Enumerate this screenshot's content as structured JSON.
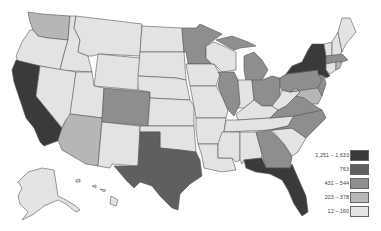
{
  "map": {
    "title": "",
    "region": "United States",
    "colors": {
      "bin1": "#3a3a3a",
      "bin2": "#5f5f5f",
      "bin3": "#8e8e8e",
      "bin4": "#b6b6b6",
      "bin5": "#e3e3e3",
      "stroke": "#555555"
    },
    "legend": [
      {
        "label": "1,251 – 1,633",
        "bin": "bin1",
        "color": "#3a3a3a"
      },
      {
        "label": "763",
        "bin": "bin2",
        "color": "#5f5f5f"
      },
      {
        "label": "431 – 544",
        "bin": "bin3",
        "color": "#8e8e8e"
      },
      {
        "label": "203 – 378",
        "bin": "bin4",
        "color": "#b6b6b6"
      },
      {
        "label": "12 – 160",
        "bin": "bin5",
        "color": "#e3e3e3"
      }
    ],
    "states": {
      "CA": "bin1",
      "NY": "bin1",
      "FL": "bin1",
      "TX": "bin2",
      "IL": "bin3",
      "GA": "bin3",
      "MN": "bin3",
      "NC": "bin3",
      "VA": "bin3",
      "MA": "bin3",
      "NJ": "bin3",
      "PA": "bin3",
      "OH": "bin3",
      "MI": "bin3",
      "WA": "bin4",
      "CO": "bin4",
      "AZ": "bin4",
      "MD": "bin4",
      "CT": "bin1"
    }
  }
}
